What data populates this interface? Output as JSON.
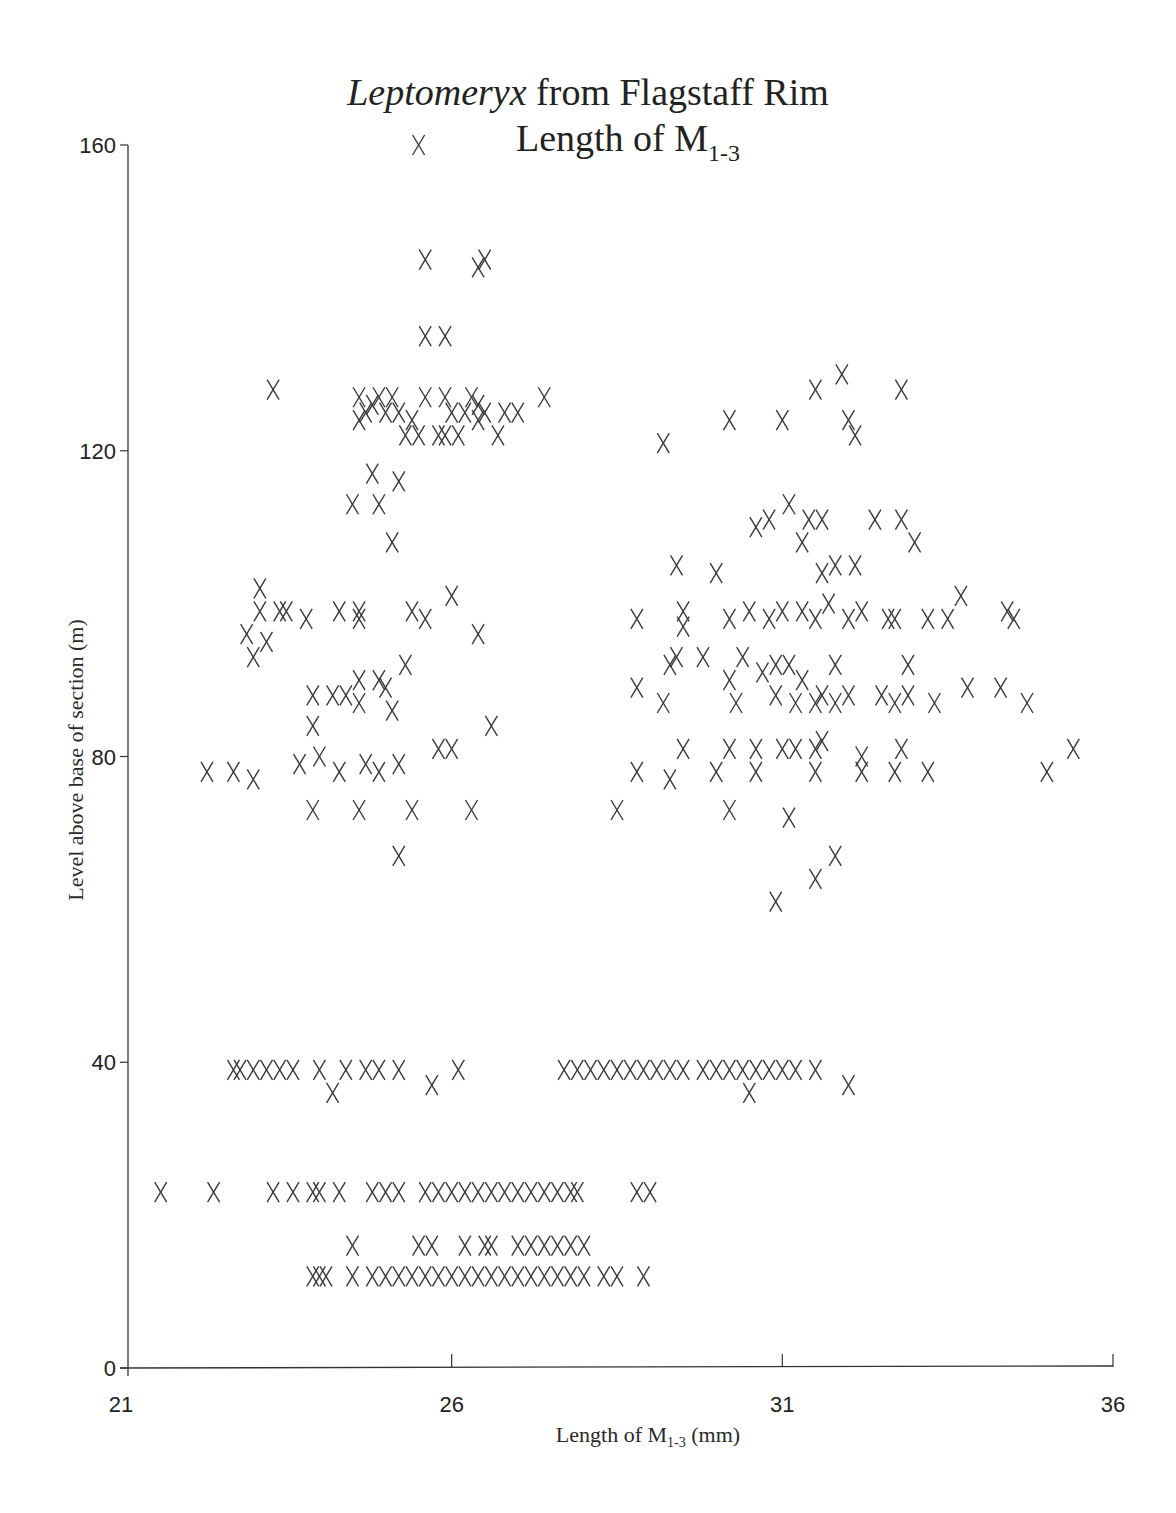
{
  "chart_data": {
    "type": "scatter",
    "title": "Leptomeryx from Flagstaff Rim",
    "title_italic_part": "Leptomeryx",
    "title_rest": " from Flagstaff Rim",
    "subtitle": "Length of M",
    "subtitle_sub": "1-3",
    "xlabel": "Length of M",
    "xlabel_sub": "1-3",
    "xlabel_unit": " (mm)",
    "ylabel": "Level above base of section (m)",
    "xlim": [
      21,
      36
    ],
    "ylim": [
      0,
      160
    ],
    "xticks": [
      21,
      26,
      31,
      36
    ],
    "yticks": [
      0,
      40,
      80,
      120,
      160
    ],
    "grid": false,
    "marker": "X",
    "marker_color": "#3a3a3a",
    "series": [
      {
        "name": "specimens",
        "points": [
          [
            25.5,
            160
          ],
          [
            25.6,
            145
          ],
          [
            26.4,
            144
          ],
          [
            26.5,
            145
          ],
          [
            25.6,
            135
          ],
          [
            25.9,
            135
          ],
          [
            23.3,
            128
          ],
          [
            24.6,
            127
          ],
          [
            24.9,
            127
          ],
          [
            25.1,
            127
          ],
          [
            25.6,
            127
          ],
          [
            25.9,
            127
          ],
          [
            26.3,
            127
          ],
          [
            26.4,
            126
          ],
          [
            27.4,
            127
          ],
          [
            24.7,
            125
          ],
          [
            24.8,
            126
          ],
          [
            25.0,
            125
          ],
          [
            25.2,
            125
          ],
          [
            25.4,
            124
          ],
          [
            26.0,
            125
          ],
          [
            26.2,
            125
          ],
          [
            26.5,
            125
          ],
          [
            26.8,
            125
          ],
          [
            27.0,
            125
          ],
          [
            24.6,
            124
          ],
          [
            25.3,
            122
          ],
          [
            25.5,
            122
          ],
          [
            25.8,
            122
          ],
          [
            25.9,
            122
          ],
          [
            26.1,
            122
          ],
          [
            26.4,
            124
          ],
          [
            26.7,
            122
          ],
          [
            24.8,
            117
          ],
          [
            25.2,
            116
          ],
          [
            24.5,
            113
          ],
          [
            24.9,
            113
          ],
          [
            25.1,
            108
          ],
          [
            23.1,
            102
          ],
          [
            23.1,
            99
          ],
          [
            23.4,
            99
          ],
          [
            23.5,
            99
          ],
          [
            23.8,
            98
          ],
          [
            24.3,
            99
          ],
          [
            24.6,
            99
          ],
          [
            24.6,
            98
          ],
          [
            25.4,
            99
          ],
          [
            25.6,
            98
          ],
          [
            26.0,
            101
          ],
          [
            22.9,
            96
          ],
          [
            23.0,
            93
          ],
          [
            23.2,
            95
          ],
          [
            26.4,
            96
          ],
          [
            23.9,
            84
          ],
          [
            23.9,
            88
          ],
          [
            24.2,
            88
          ],
          [
            24.4,
            88
          ],
          [
            24.6,
            90
          ],
          [
            24.6,
            87
          ],
          [
            24.9,
            90
          ],
          [
            25.0,
            89
          ],
          [
            25.1,
            86
          ],
          [
            25.3,
            92
          ],
          [
            26.6,
            84
          ],
          [
            22.3,
            78
          ],
          [
            22.7,
            78
          ],
          [
            23.0,
            77
          ],
          [
            23.7,
            79
          ],
          [
            24.0,
            80
          ],
          [
            24.3,
            78
          ],
          [
            24.7,
            79
          ],
          [
            24.9,
            78
          ],
          [
            25.2,
            79
          ],
          [
            25.8,
            81
          ],
          [
            26.0,
            81
          ],
          [
            23.9,
            73
          ],
          [
            24.6,
            73
          ],
          [
            25.4,
            73
          ],
          [
            26.3,
            73
          ],
          [
            25.2,
            67
          ],
          [
            29.2,
            121
          ],
          [
            30.2,
            124
          ],
          [
            31.0,
            124
          ],
          [
            32.0,
            124
          ],
          [
            32.1,
            122
          ],
          [
            31.5,
            128
          ],
          [
            31.9,
            130
          ],
          [
            32.8,
            128
          ],
          [
            30.6,
            110
          ],
          [
            30.8,
            111
          ],
          [
            31.1,
            113
          ],
          [
            31.3,
            108
          ],
          [
            31.4,
            111
          ],
          [
            31.6,
            111
          ],
          [
            32.4,
            111
          ],
          [
            32.8,
            111
          ],
          [
            31.8,
            105
          ],
          [
            32.1,
            105
          ],
          [
            33.0,
            108
          ],
          [
            31.6,
            104
          ],
          [
            29.4,
            105
          ],
          [
            30.0,
            104
          ],
          [
            28.8,
            98
          ],
          [
            29.5,
            99
          ],
          [
            29.5,
            97
          ],
          [
            30.2,
            98
          ],
          [
            30.5,
            99
          ],
          [
            30.8,
            98
          ],
          [
            31.0,
            99
          ],
          [
            31.3,
            99
          ],
          [
            31.5,
            98
          ],
          [
            31.7,
            100
          ],
          [
            32.0,
            98
          ],
          [
            32.2,
            99
          ],
          [
            32.6,
            98
          ],
          [
            32.7,
            98
          ],
          [
            33.2,
            98
          ],
          [
            33.5,
            98
          ],
          [
            33.7,
            101
          ],
          [
            34.4,
            99
          ],
          [
            34.5,
            98
          ],
          [
            29.3,
            92
          ],
          [
            29.4,
            93
          ],
          [
            29.8,
            93
          ],
          [
            30.2,
            90
          ],
          [
            30.4,
            93
          ],
          [
            30.7,
            91
          ],
          [
            30.9,
            92
          ],
          [
            31.1,
            92
          ],
          [
            31.3,
            90
          ],
          [
            31.8,
            92
          ],
          [
            32.9,
            92
          ],
          [
            28.8,
            89
          ],
          [
            29.2,
            87
          ],
          [
            30.3,
            87
          ],
          [
            30.9,
            88
          ],
          [
            31.2,
            87
          ],
          [
            31.5,
            87
          ],
          [
            31.6,
            88
          ],
          [
            31.8,
            87
          ],
          [
            32.0,
            88
          ],
          [
            32.5,
            88
          ],
          [
            32.7,
            87
          ],
          [
            32.9,
            88
          ],
          [
            33.3,
            87
          ],
          [
            33.8,
            89
          ],
          [
            34.3,
            89
          ],
          [
            34.7,
            87
          ],
          [
            29.5,
            81
          ],
          [
            30.2,
            81
          ],
          [
            30.6,
            81
          ],
          [
            31.0,
            81
          ],
          [
            31.2,
            81
          ],
          [
            31.5,
            81
          ],
          [
            31.6,
            82
          ],
          [
            32.2,
            80
          ],
          [
            32.8,
            81
          ],
          [
            35.4,
            81
          ],
          [
            28.8,
            78
          ],
          [
            29.3,
            77
          ],
          [
            30.0,
            78
          ],
          [
            30.6,
            78
          ],
          [
            31.5,
            78
          ],
          [
            32.2,
            78
          ],
          [
            32.7,
            78
          ],
          [
            33.2,
            78
          ],
          [
            35.0,
            78
          ],
          [
            28.5,
            73
          ],
          [
            30.2,
            73
          ],
          [
            31.1,
            72
          ],
          [
            31.8,
            67
          ],
          [
            31.5,
            64
          ],
          [
            30.9,
            61
          ],
          [
            22.7,
            39
          ],
          [
            22.8,
            39
          ],
          [
            23.0,
            39
          ],
          [
            23.2,
            39
          ],
          [
            23.4,
            39
          ],
          [
            23.6,
            39
          ],
          [
            24.0,
            39
          ],
          [
            24.2,
            36
          ],
          [
            24.4,
            39
          ],
          [
            24.7,
            39
          ],
          [
            24.9,
            39
          ],
          [
            25.2,
            39
          ],
          [
            25.7,
            37
          ],
          [
            26.1,
            39
          ],
          [
            27.7,
            39
          ],
          [
            27.9,
            39
          ],
          [
            28.1,
            39
          ],
          [
            28.3,
            39
          ],
          [
            28.5,
            39
          ],
          [
            28.7,
            39
          ],
          [
            28.9,
            39
          ],
          [
            29.1,
            39
          ],
          [
            29.3,
            39
          ],
          [
            29.5,
            39
          ],
          [
            29.8,
            39
          ],
          [
            30.0,
            39
          ],
          [
            30.2,
            39
          ],
          [
            30.4,
            39
          ],
          [
            30.5,
            36
          ],
          [
            30.6,
            39
          ],
          [
            30.8,
            39
          ],
          [
            31.0,
            39
          ],
          [
            31.2,
            39
          ],
          [
            31.5,
            39
          ],
          [
            32.0,
            37
          ],
          [
            21.6,
            23
          ],
          [
            22.4,
            23
          ],
          [
            23.3,
            23
          ],
          [
            23.6,
            23
          ],
          [
            23.9,
            23
          ],
          [
            24.0,
            23
          ],
          [
            24.3,
            23
          ],
          [
            24.8,
            23
          ],
          [
            25.0,
            23
          ],
          [
            25.2,
            23
          ],
          [
            25.6,
            23
          ],
          [
            25.8,
            23
          ],
          [
            26.0,
            23
          ],
          [
            26.2,
            23
          ],
          [
            26.4,
            23
          ],
          [
            26.6,
            23
          ],
          [
            26.8,
            23
          ],
          [
            27.0,
            23
          ],
          [
            27.2,
            23
          ],
          [
            27.4,
            23
          ],
          [
            27.6,
            23
          ],
          [
            27.8,
            23
          ],
          [
            27.9,
            23
          ],
          [
            28.8,
            23
          ],
          [
            29.0,
            23
          ],
          [
            24.5,
            16
          ],
          [
            25.5,
            16
          ],
          [
            25.7,
            16
          ],
          [
            26.2,
            16
          ],
          [
            26.5,
            16
          ],
          [
            26.6,
            16
          ],
          [
            27.0,
            16
          ],
          [
            27.2,
            16
          ],
          [
            27.4,
            16
          ],
          [
            27.6,
            16
          ],
          [
            27.8,
            16
          ],
          [
            28.0,
            16
          ],
          [
            23.9,
            12
          ],
          [
            24.0,
            12
          ],
          [
            24.1,
            12
          ],
          [
            24.5,
            12
          ],
          [
            24.8,
            12
          ],
          [
            25.0,
            12
          ],
          [
            25.2,
            12
          ],
          [
            25.4,
            12
          ],
          [
            25.6,
            12
          ],
          [
            25.8,
            12
          ],
          [
            26.0,
            12
          ],
          [
            26.2,
            12
          ],
          [
            26.4,
            12
          ],
          [
            26.6,
            12
          ],
          [
            26.8,
            12
          ],
          [
            27.0,
            12
          ],
          [
            27.2,
            12
          ],
          [
            27.4,
            12
          ],
          [
            27.6,
            12
          ],
          [
            27.8,
            12
          ],
          [
            28.0,
            12
          ],
          [
            28.3,
            12
          ],
          [
            28.5,
            12
          ],
          [
            28.9,
            12
          ]
        ]
      }
    ]
  }
}
